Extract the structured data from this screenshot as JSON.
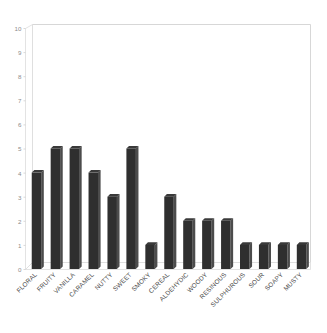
{
  "chart_data": {
    "type": "bar",
    "title": "",
    "subtitle": "",
    "xlabel": "",
    "ylabel": "",
    "ylim": [
      0,
      10
    ],
    "yticks": [
      "0",
      "1",
      "2",
      "3",
      "4",
      "5",
      "6",
      "7",
      "8",
      "9",
      "10"
    ],
    "grid": false,
    "legend": null,
    "legend_position": "none",
    "orientation": "vertical",
    "style": "3d-perspective",
    "bar_color": "#2f2f2f",
    "bar_side_color": "#4c4c4c",
    "frame_color": "#dcdcdc",
    "background_color": "#ffffff",
    "axis_label_color": "#8c8c8c",
    "tick_label_rotation_deg": 45,
    "categories": [
      "FLORAL",
      "FRUITY",
      "VANILLA",
      "CARAMEL",
      "NUTTY",
      "SWEET",
      "SMOKY",
      "CEREAL",
      "ALDEHYDIC",
      "WOODY",
      "RESINOUS",
      "SULPHUROUS",
      "SOUR",
      "SOAPY",
      "MUSTY"
    ],
    "values": [
      4,
      5,
      5,
      4,
      3,
      5,
      1,
      3,
      2,
      2,
      2,
      1,
      1,
      1,
      1
    ]
  }
}
